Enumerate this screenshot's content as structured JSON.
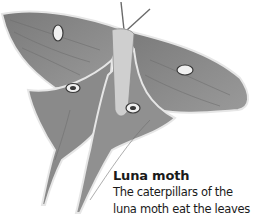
{
  "figure": {
    "colors": {
      "background": "#ffffff",
      "wing_fill": "#8e8e8e",
      "wing_dark": "#5a5a5a",
      "wing_edge": "#e8e8e8",
      "text": "#1a1a1a"
    }
  },
  "caption": {
    "title": "Luna moth",
    "lines": [
      "The caterpillars of the",
      "luna moth eat the leaves"
    ]
  }
}
